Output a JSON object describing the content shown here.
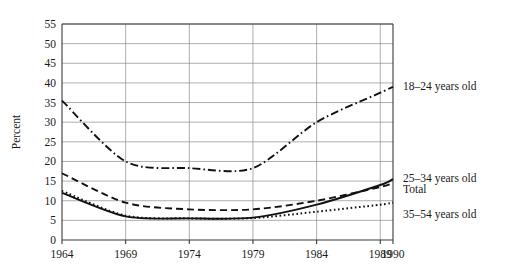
{
  "chart_data": {
    "type": "line",
    "title": "",
    "xlabel": "",
    "ylabel": "Percent",
    "x": [
      1964,
      1969,
      1974,
      1979,
      1984,
      1989,
      1990
    ],
    "xticklabels": [
      "1964",
      "1969",
      "1974",
      "1979",
      "1984",
      "1989",
      "1990"
    ],
    "yticklabels": [
      "0",
      "5",
      "10",
      "15",
      "20",
      "25",
      "30",
      "35",
      "40",
      "45",
      "50",
      "55"
    ],
    "yticks": [
      0,
      5,
      10,
      15,
      20,
      25,
      30,
      35,
      40,
      45,
      50,
      55
    ],
    "ylim": [
      0,
      55
    ],
    "grid": "both",
    "legend_position": "right-inline",
    "series": [
      {
        "name": "18–24 years old",
        "label": "18–24 years old",
        "linestyle": "dashdot",
        "color": "#111111",
        "values": [
          35.5,
          20.0,
          18.3,
          18.3,
          30.0,
          37.5,
          39.0
        ]
      },
      {
        "name": "25–34 years old",
        "label": "25–34 years old",
        "linestyle": "dashed",
        "color": "#111111",
        "values": [
          17.0,
          9.5,
          7.8,
          7.8,
          10.0,
          13.5,
          14.5
        ]
      },
      {
        "name": "Total",
        "label": "Total",
        "linestyle": "solid",
        "color": "#111111",
        "values": [
          12.0,
          6.0,
          5.5,
          5.7,
          9.0,
          14.0,
          15.5
        ]
      },
      {
        "name": "35–54 years old",
        "label": "35–54 years old",
        "linestyle": "dotted",
        "color": "#111111",
        "values": [
          12.5,
          6.2,
          5.5,
          5.6,
          7.2,
          9.0,
          9.5
        ]
      }
    ]
  },
  "axes": {
    "y_title": "Percent"
  }
}
